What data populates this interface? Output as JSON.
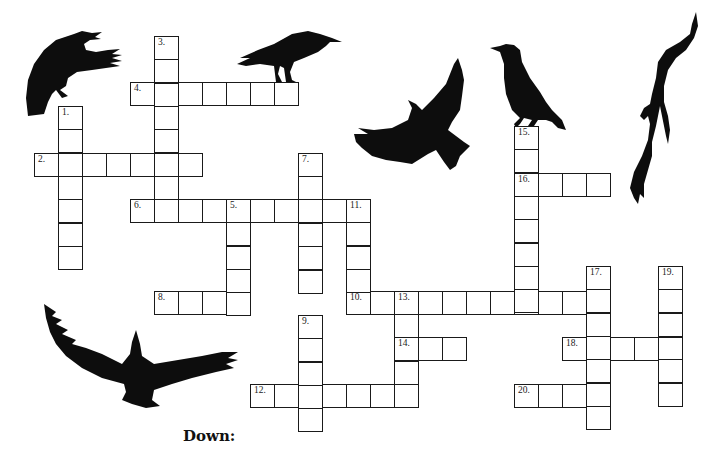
{
  "puzzle": {
    "cell_width": 24,
    "cell_height": 23.3,
    "border_color": "#1a1a1a",
    "words": [
      {
        "num": "1.",
        "dir": "down",
        "x": 58,
        "y": 106,
        "len": 7
      },
      {
        "num": "2.",
        "dir": "across",
        "x": 34,
        "y": 153,
        "len": 7
      },
      {
        "num": "3.",
        "dir": "down",
        "x": 154,
        "y": 36,
        "len": 8
      },
      {
        "num": "4.",
        "dir": "across",
        "x": 130,
        "y": 82,
        "len": 7
      },
      {
        "num": "5.",
        "dir": "down",
        "x": 226,
        "y": 199,
        "len": 5
      },
      {
        "num": "6.",
        "dir": "across",
        "x": 130,
        "y": 199,
        "len": 10
      },
      {
        "num": "7.",
        "dir": "down",
        "x": 298,
        "y": 153,
        "len": 6
      },
      {
        "num": "8.",
        "dir": "across",
        "x": 154,
        "y": 291,
        "len": 4
      },
      {
        "num": "9.",
        "dir": "down",
        "x": 298,
        "y": 315,
        "len": 5
      },
      {
        "num": "10.",
        "dir": "across",
        "x": 346,
        "y": 291,
        "len": 11
      },
      {
        "num": "11.",
        "dir": "down",
        "x": 346,
        "y": 199,
        "len": 5
      },
      {
        "num": "12.",
        "dir": "across",
        "x": 250,
        "y": 384,
        "len": 7
      },
      {
        "num": "13.",
        "dir": "down",
        "x": 394,
        "y": 291,
        "len": 5
      },
      {
        "num": "14.",
        "dir": "across",
        "x": 394,
        "y": 337,
        "len": 3
      },
      {
        "num": "15.",
        "dir": "down",
        "x": 514,
        "y": 126,
        "len": 8
      },
      {
        "num": "16.",
        "dir": "across",
        "x": 514,
        "y": 173,
        "len": 4
      },
      {
        "num": "17.",
        "dir": "down",
        "x": 586,
        "y": 266,
        "len": 7
      },
      {
        "num": "18.",
        "dir": "across",
        "x": 562,
        "y": 337,
        "len": 5
      },
      {
        "num": "19.",
        "dir": "down",
        "x": 658,
        "y": 266,
        "len": 6
      },
      {
        "num": "20.",
        "dir": "across",
        "x": 514,
        "y": 384,
        "len": 4
      }
    ]
  },
  "decorations": {
    "crow_color": "#0d0d0d",
    "crows": [
      "crow-landing-topleft",
      "crow-perched-on-4-across",
      "crow-flying-center",
      "crow-perched-on-15-down",
      "crow-diving-right",
      "crow-soaring-bottomleft"
    ]
  },
  "clues": {
    "down_heading": "Down:"
  }
}
